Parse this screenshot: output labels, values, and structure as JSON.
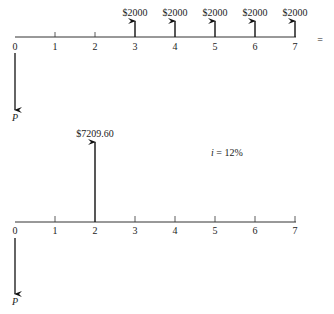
{
  "diagram1": {
    "periods": [
      "0",
      "1",
      "2",
      "3",
      "4",
      "5",
      "6",
      "7"
    ],
    "cash_flows": [
      {
        "period": 3,
        "label": "$2000"
      },
      {
        "period": 4,
        "label": "$2000"
      },
      {
        "period": 5,
        "label": "$2000"
      },
      {
        "period": 6,
        "label": "$2000"
      },
      {
        "period": 7,
        "label": "$2000"
      }
    ],
    "outflow_label": "P",
    "equals_sign": "="
  },
  "diagram2": {
    "periods": [
      "0",
      "1",
      "2",
      "3",
      "4",
      "5",
      "6",
      "7"
    ],
    "cash_flow": {
      "period": 2,
      "label": "$7209.60"
    },
    "interest_label": "i",
    "interest_value": " = 12%",
    "outflow_label": "P"
  }
}
